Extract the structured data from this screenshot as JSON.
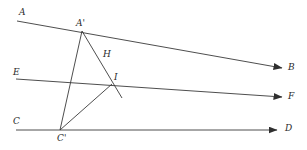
{
  "figure": {
    "kind": "geometry-diagram",
    "width": 307,
    "height": 150,
    "background_color": "#ffffff",
    "stroke_color": "#3a3a3a",
    "label_color": "#2b2b2b"
  },
  "labels": {
    "A": "A",
    "A_prime": "A'",
    "B": "B",
    "C": "C",
    "C_prime": "C'",
    "D": "D",
    "E": "E",
    "F": "F",
    "H": "H",
    "I": "I"
  },
  "label_positions": {
    "A": {
      "x": 19,
      "y": 8
    },
    "A_prime": {
      "x": 76,
      "y": 19
    },
    "B": {
      "x": 288,
      "y": 63
    },
    "C": {
      "x": 13,
      "y": 117
    },
    "C_prime": {
      "x": 57,
      "y": 134
    },
    "D": {
      "x": 285,
      "y": 124
    },
    "E": {
      "x": 13,
      "y": 68
    },
    "F": {
      "x": 288,
      "y": 92
    },
    "H": {
      "x": 103,
      "y": 50
    },
    "I": {
      "x": 114,
      "y": 73
    }
  },
  "points": {
    "A_prime": {
      "x": 82,
      "y": 31
    },
    "C_prime": {
      "x": 60,
      "y": 130
    },
    "I": {
      "x": 112,
      "y": 84
    },
    "H_on_line": {
      "x": 100,
      "y": 62
    }
  },
  "rays": [
    {
      "name": "ray-AB",
      "from_label": "A",
      "to_label": "B",
      "x1": 17,
      "y1": 21,
      "x2": 282,
      "y2": 68,
      "arrow": true
    },
    {
      "name": "ray-EF",
      "from_label": "E",
      "to_label": "F",
      "x1": 16,
      "y1": 79,
      "x2": 282,
      "y2": 97,
      "arrow": true
    },
    {
      "name": "ray-CD",
      "from_label": "C",
      "to_label": "D",
      "x1": 16,
      "y1": 130,
      "x2": 277,
      "y2": 130,
      "arrow": true
    }
  ],
  "segments": [
    {
      "name": "segment-A-prime-C-prime",
      "x1": 82,
      "y1": 31,
      "x2": 60,
      "y2": 130
    },
    {
      "name": "segment-A-prime-through-I",
      "x1": 82,
      "y1": 31,
      "x2": 122,
      "y2": 98
    },
    {
      "name": "segment-C-prime-I",
      "x1": 60,
      "y1": 130,
      "x2": 112,
      "y2": 84
    }
  ],
  "frame": {
    "border_color": "#d9d9d9",
    "visible": false
  }
}
